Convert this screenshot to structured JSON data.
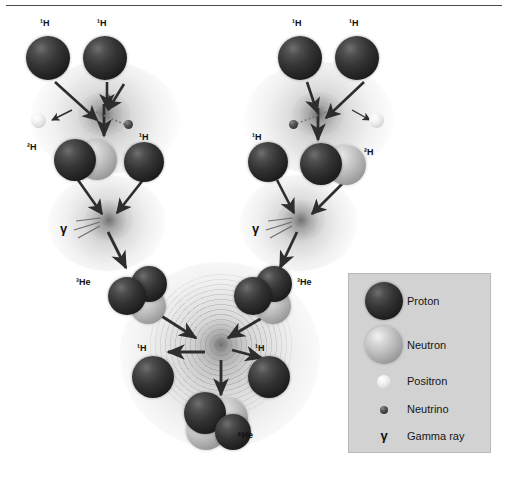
{
  "figure": {
    "background_color": "#ffffff",
    "rule_color": "#4a4a4a"
  },
  "particles": {
    "proton": {
      "name": "proton",
      "color": "#232323"
    },
    "neutron": {
      "name": "neutron",
      "color": "#bdbdbd"
    },
    "positron": {
      "name": "positron",
      "color": "#f0f0f0"
    },
    "neutrino": {
      "name": "neutrino",
      "color": "#4a4a4a"
    },
    "gamma": {
      "name": "gamma ray",
      "symbol": "γ",
      "color": "#111111"
    }
  },
  "labels": {
    "h1": "¹H",
    "h2": "²H",
    "he3": "³He",
    "he4": "⁴He",
    "gamma": "γ"
  },
  "diagram_labels": [
    {
      "id": "left-h1-a",
      "text": "¹H",
      "x": 40,
      "y": 18
    },
    {
      "id": "left-h1-b",
      "text": "¹H",
      "x": 97,
      "y": 18
    },
    {
      "id": "left-h2",
      "text": "²H",
      "x": 27,
      "y": 142
    },
    {
      "id": "left-h1-c",
      "text": "¹H",
      "x": 139,
      "y": 132
    },
    {
      "id": "left-gamma",
      "text": "γ",
      "x": 60,
      "y": 222
    },
    {
      "id": "left-he3",
      "text": "³He",
      "x": 76,
      "y": 277
    },
    {
      "id": "right-h1-a",
      "text": "¹H",
      "x": 292,
      "y": 18
    },
    {
      "id": "right-h1-b",
      "text": "¹H",
      "x": 349,
      "y": 18
    },
    {
      "id": "right-h2",
      "text": "²H",
      "x": 364,
      "y": 147
    },
    {
      "id": "right-h1-c",
      "text": "¹H",
      "x": 252,
      "y": 132
    },
    {
      "id": "right-gamma",
      "text": "γ",
      "x": 252,
      "y": 222
    },
    {
      "id": "right-he3",
      "text": "³He",
      "x": 297,
      "y": 277
    },
    {
      "id": "center-h1-left",
      "text": "¹H",
      "x": 137,
      "y": 343
    },
    {
      "id": "center-h1-right",
      "text": "¹H",
      "x": 255,
      "y": 343
    },
    {
      "id": "product-he4",
      "text": "⁴He",
      "x": 237,
      "y": 430
    }
  ],
  "legend": {
    "background_color": "#d2d2d2",
    "border_color": "#b9b9b9",
    "items": [
      {
        "type": "proton",
        "label": "Proton",
        "swatch_size": 38
      },
      {
        "type": "neutron",
        "label": "Neutron",
        "swatch_size": 38
      },
      {
        "type": "positron",
        "label": "Positron",
        "swatch_size": 14
      },
      {
        "type": "neutrino",
        "label": "Neutrino",
        "swatch_size": 8
      },
      {
        "type": "gamma",
        "label": "Gamma ray",
        "symbol": "γ"
      }
    ]
  }
}
